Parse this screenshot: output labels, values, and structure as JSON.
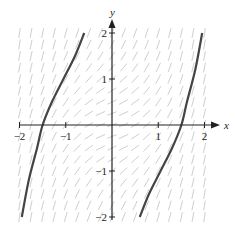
{
  "diagram": {
    "type": "slope-field",
    "axes": {
      "x_label": "x",
      "y_label": "y",
      "x_range": [
        -2,
        2
      ],
      "y_range": [
        -2,
        2
      ],
      "x_ticks": [
        {
          "value": -2,
          "label": "−2"
        },
        {
          "value": -1,
          "label": "−1"
        },
        {
          "value": 1,
          "label": "1"
        },
        {
          "value": 2,
          "label": "2"
        }
      ],
      "y_ticks": [
        {
          "value": 2,
          "label": "2"
        },
        {
          "value": 1,
          "label": "1"
        },
        {
          "value": -1,
          "label": "−1"
        },
        {
          "value": -2,
          "label": "−2"
        }
      ]
    },
    "colors": {
      "axis": "#222222",
      "field_segments": "#c8c8c8",
      "solution_curve": "#444444"
    },
    "solution_curves": [
      {
        "name": "left-curve",
        "points": [
          [
            -1.95,
            -2
          ],
          [
            -1.8,
            -1.2
          ],
          [
            -1.62,
            -0.5
          ],
          [
            -1.5,
            0
          ],
          [
            -1.3,
            0.5
          ],
          [
            -1.05,
            1.0
          ],
          [
            -0.8,
            1.5
          ],
          [
            -0.6,
            2
          ]
        ]
      },
      {
        "name": "right-curve",
        "points": [
          [
            0.6,
            -2
          ],
          [
            0.8,
            -1.5
          ],
          [
            1.05,
            -1.0
          ],
          [
            1.3,
            -0.5
          ],
          [
            1.5,
            0
          ],
          [
            1.62,
            0.5
          ],
          [
            1.8,
            1.2
          ],
          [
            1.95,
            2
          ]
        ]
      }
    ]
  }
}
